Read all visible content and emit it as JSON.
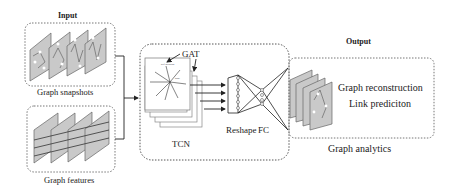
{
  "input": {
    "title": "Input",
    "snapshots_label": "Graph snapshots",
    "features_label": "Graph features"
  },
  "model": {
    "gat_label": "GAT",
    "tcn_label": "TCN",
    "reshape_label": "Reshape",
    "fc_label": "FC",
    "attention_caption": "self-attention",
    "node_caption": "node"
  },
  "output": {
    "title": "Output",
    "tasks": [
      "Graph reconstruction",
      "Link prediciton"
    ],
    "analytics_label": "Graph analytics"
  },
  "colors": {
    "panel_fill": "#c8c8c8",
    "panel_stroke": "#555555",
    "box_dash": "#666666",
    "line": "#222222"
  }
}
